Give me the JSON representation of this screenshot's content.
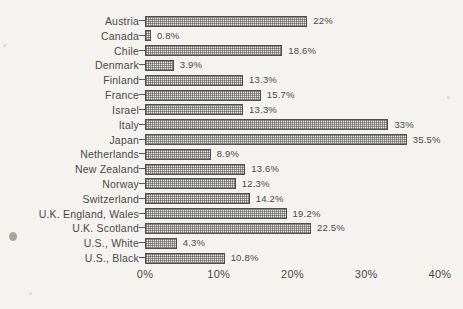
{
  "chart_data": {
    "type": "bar",
    "orientation": "horizontal",
    "title": "",
    "subtitle": "",
    "xlabel": "",
    "ylabel": "",
    "xlim": [
      0,
      40
    ],
    "grid": false,
    "legend": null,
    "value_suffix": "%",
    "axis_ticks": [
      "0%",
      "10%",
      "20%",
      "30%",
      "40%"
    ],
    "axis_tick_values": [
      0,
      10,
      20,
      30,
      40
    ],
    "categories": [
      "Austria",
      "Canada",
      "Chile",
      "Denmark",
      "Finland",
      "France",
      "Israel",
      "Italy",
      "Japan",
      "Netherlands",
      "New Zealand",
      "Norway",
      "Switzerland",
      "U.K. England, Wales",
      "U.K. Scotland",
      "U.S., White",
      "U.S., Black"
    ],
    "values": [
      22,
      0.8,
      18.6,
      3.9,
      13.3,
      15.7,
      13.3,
      33,
      35.5,
      8.9,
      13.6,
      12.3,
      14.2,
      19.2,
      22.5,
      4.3,
      10.8
    ],
    "value_labels": [
      "22%",
      "0.8%",
      "18.6%",
      "3.9%",
      "13.3%",
      "15.7%",
      "13.3%",
      "33%",
      "35.5%",
      "8.9%",
      "13.6%",
      "12.3%",
      "14.2%",
      "19.2%",
      "22.5%",
      "4.3%",
      "10.8%"
    ],
    "colors": {
      "background": "#f4f3ef",
      "bar_fill": "#e8e7e2",
      "bar_hatch": "#505050",
      "bar_outline": "#4d4d4d",
      "text": "#4a4a4a"
    }
  }
}
